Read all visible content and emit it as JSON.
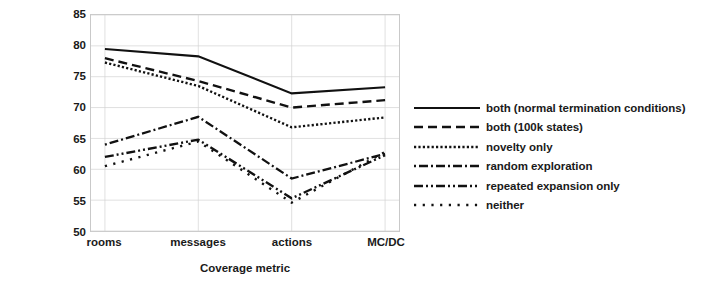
{
  "chart_data": {
    "type": "line",
    "title": "",
    "xlabel": "Coverage metric",
    "ylabel": "Average coverage (%)",
    "categories": [
      "rooms",
      "messages",
      "actions",
      "MC/DC"
    ],
    "ylim": [
      50,
      85
    ],
    "yticks": [
      50,
      55,
      60,
      65,
      70,
      75,
      80,
      85
    ],
    "grid": true,
    "legend_position": "right",
    "line_color": "#111111",
    "series": [
      {
        "name": "both (normal termination conditions)",
        "values": [
          79.5,
          78.3,
          72.3,
          73.3
        ],
        "dash": "solid",
        "dasharray": "",
        "width": 2.1
      },
      {
        "name": "both (100k states)",
        "values": [
          78.0,
          74.3,
          70.0,
          71.2
        ],
        "dash": "dashed",
        "dasharray": "9,5",
        "width": 2.4
      },
      {
        "name": "novelty only",
        "values": [
          77.3,
          73.5,
          66.8,
          68.4
        ],
        "dash": "dotted",
        "dasharray": "2.2,2.2",
        "width": 2.4
      },
      {
        "name": "random exploration",
        "values": [
          64.0,
          68.5,
          58.5,
          62.5
        ],
        "dash": "dash-dot",
        "dasharray": "2,3,9,3",
        "width": 2.3
      },
      {
        "name": "repeated expansion only",
        "values": [
          62.0,
          64.8,
          55.3,
          62.3
        ],
        "dash": "dash-dot-dot",
        "dasharray": "9,3,2,3,2,3",
        "width": 2.4
      },
      {
        "name": "neither",
        "values": [
          60.5,
          64.5,
          54.6,
          62.8
        ],
        "dash": "loose-dotted",
        "dasharray": "2.2,6.5",
        "width": 2.4
      }
    ]
  },
  "yaxis": {
    "title": "Average coverage (%)",
    "ticks": [
      "85",
      "80",
      "75",
      "70",
      "65",
      "60",
      "55",
      "50"
    ]
  },
  "xaxis": {
    "title": "Coverage metric",
    "ticks": [
      "rooms",
      "messages",
      "actions",
      "MC/DC"
    ]
  },
  "legend": {
    "items": [
      {
        "label": "both (normal termination conditions)"
      },
      {
        "label": "both (100k states)"
      },
      {
        "label": "novelty only"
      },
      {
        "label": "random exploration"
      },
      {
        "label": "repeated expansion only"
      },
      {
        "label": "neither"
      }
    ]
  }
}
